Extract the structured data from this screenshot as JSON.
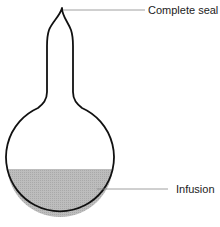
{
  "diagram": {
    "labels": {
      "seal": "Complete seal",
      "infusion": "Infusion"
    },
    "colors": {
      "outline": "#111111",
      "liquid_fill": "#b4b4b4",
      "leader_line": "#888888",
      "text": "#222222",
      "background": "#ffffff"
    }
  }
}
